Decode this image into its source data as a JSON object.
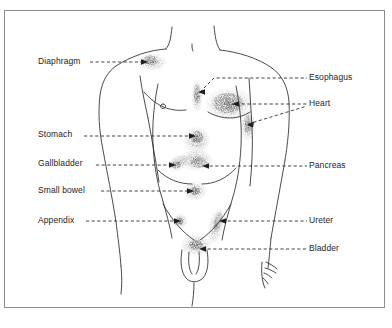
{
  "figure": {
    "frame_border_color": "#8d8d8d",
    "background_color": "#ffffff",
    "ink_color": "#1d1d1d",
    "stipple_color": "#4a4a4a",
    "caption": ""
  },
  "labels_left": [
    {
      "id": "diaphragm",
      "text": "Diaphragm",
      "x": 38,
      "y": 57
    },
    {
      "id": "stomach",
      "text": "Stomach",
      "x": 38,
      "y": 129
    },
    {
      "id": "gallbladder",
      "text": "Gallbladder",
      "x": 38,
      "y": 158
    },
    {
      "id": "small-bowel",
      "text": "Small bowel",
      "x": 38,
      "y": 186
    },
    {
      "id": "appendix",
      "text": "Appendix",
      "x": 38,
      "y": 214
    }
  ],
  "labels_right": [
    {
      "id": "esophagus",
      "text": "Esophagus",
      "x": 312,
      "y": 71
    },
    {
      "id": "heart",
      "text": "Heart",
      "x": 312,
      "y": 98
    },
    {
      "id": "pancreas",
      "text": "Pancreas",
      "x": 312,
      "y": 159
    },
    {
      "id": "ureter",
      "text": "Ureter",
      "x": 312,
      "y": 214
    },
    {
      "id": "bladder",
      "text": "Bladder",
      "x": 312,
      "y": 242
    }
  ],
  "organ_sites": [
    {
      "id": "diaphragm-site",
      "label": "Diaphragm",
      "cx": 152,
      "cy": 62
    },
    {
      "id": "esophagus-site",
      "label": "Esophagus",
      "cx": 196,
      "cy": 90
    },
    {
      "id": "heart-site",
      "label": "Heart",
      "cx": 232,
      "cy": 103
    },
    {
      "id": "heart-site-lower",
      "label": "Heart",
      "cx": 247,
      "cy": 124
    },
    {
      "id": "stomach-site",
      "label": "Stomach",
      "cx": 197,
      "cy": 136
    },
    {
      "id": "gallbladder-site",
      "label": "Gallbladder",
      "cx": 176,
      "cy": 165
    },
    {
      "id": "pancreas-site",
      "label": "Pancreas",
      "cx": 200,
      "cy": 166
    },
    {
      "id": "small-bowel-site",
      "label": "Small bowel",
      "cx": 195,
      "cy": 191
    },
    {
      "id": "appendix-site",
      "label": "Appendix",
      "cx": 180,
      "cy": 221
    },
    {
      "id": "ureter-site",
      "label": "Ureter",
      "cx": 218,
      "cy": 220
    },
    {
      "id": "bladder-site",
      "label": "Bladder",
      "cx": 196,
      "cy": 245
    }
  ]
}
